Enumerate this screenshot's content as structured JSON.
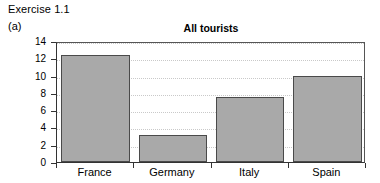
{
  "header": {
    "exercise": "Exercise 1.1",
    "part": "(a)"
  },
  "chart_data": {
    "type": "bar",
    "title": "All tourists",
    "xlabel": "",
    "ylabel": "",
    "categories": [
      "France",
      "Germany",
      "Italy",
      "Spain"
    ],
    "values": [
      12.4,
      3.1,
      7.5,
      9.9
    ],
    "ylim": [
      0,
      14
    ],
    "yticks": [
      0,
      2,
      4,
      6,
      8,
      10,
      12,
      14
    ],
    "ytick_labels": [
      "0",
      "2",
      "4",
      "6",
      "8",
      "10",
      "12",
      "14"
    ],
    "grid": true,
    "grid_axis": "y",
    "grid_style": "dotted",
    "legend": false,
    "bar_color": "#a9a9a9",
    "bar_edge_color": "#4a4a4a",
    "grid_color": "#c9c9c9",
    "axis_color": "#333333"
  }
}
